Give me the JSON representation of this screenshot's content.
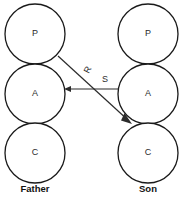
{
  "diagram": {
    "background_color": "#ffffff",
    "stroke_color": "#1a1a1a",
    "text_color": "#2b2b2b",
    "columns": [
      {
        "id": "father",
        "group_label": "Father",
        "group_label_x": 35,
        "group_label_y": 189,
        "center_x": 35,
        "nodes": [
          {
            "label": "P",
            "cx": 35,
            "cy": 34,
            "r": 30
          },
          {
            "label": "A",
            "cx": 35,
            "cy": 94,
            "r": 30
          },
          {
            "label": "C",
            "cx": 35,
            "cy": 153,
            "r": 30
          }
        ]
      },
      {
        "id": "son",
        "group_label": "Son",
        "group_label_x": 148,
        "group_label_y": 189,
        "center_x": 148,
        "nodes": [
          {
            "label": "P",
            "cx": 148,
            "cy": 34,
            "r": 30
          },
          {
            "label": "A",
            "cx": 148,
            "cy": 94,
            "r": 30
          },
          {
            "label": "C",
            "cx": 148,
            "cy": 153,
            "r": 30
          }
        ]
      }
    ],
    "edges": [
      {
        "id": "edge-s",
        "label": "S",
        "from": "son-adult",
        "to": "father-adult",
        "x1": 118,
        "y1": 89,
        "x2": 66,
        "y2": 89,
        "label_x": 105,
        "label_y": 81,
        "label_rotation": 0,
        "arrow_at": "end",
        "arrow_direction": "left"
      },
      {
        "id": "edge-r",
        "label": "R",
        "from": "father-parent",
        "to": "son-child",
        "x1": 58,
        "y1": 56,
        "x2": 131,
        "y2": 123,
        "label_x": 88,
        "label_y": 70,
        "label_rotation": -63,
        "arrow_at": "end",
        "arrow_direction": "down-right"
      }
    ]
  }
}
